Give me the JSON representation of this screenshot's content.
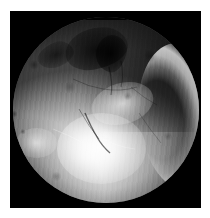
{
  "document": {
    "kind": "medical-endoscopic-still",
    "modality": "arthroscopy",
    "orientation": "portrait",
    "width_px": 210,
    "height_px": 218,
    "caption": "",
    "overlay_text": "",
    "has_annotations": false
  },
  "page": {
    "background_color": "#ffffff"
  },
  "frame": {
    "name": "letterbox-frame",
    "background_color": "#000000",
    "left_px": 10,
    "top_px": 11,
    "width_px": 191,
    "height_px": 197
  },
  "field_of_view": {
    "shape": "circle",
    "diameter_px": 186,
    "top_edge_clipped": true,
    "rim_color": "#000000"
  },
  "palette": {
    "background": "#ffffff",
    "frame": "#000000",
    "highlight": "#ffffff",
    "midtone": "#bdbdbd",
    "shadow": "#3a3a3a",
    "deep_shadow": "#101010"
  },
  "features": [
    {
      "name": "specular-highlight-main",
      "description": "large blown-out specular reflection, lower centre-left",
      "position": "lower-centre-left",
      "intensity": "very-bright"
    },
    {
      "name": "specular-highlight-secondary",
      "description": "softer glare band above the main highlight",
      "position": "centre",
      "intensity": "bright"
    },
    {
      "name": "crescent-glare",
      "description": "bright crescent of reflected light along the right rim of the field of view",
      "position": "right-rim",
      "intensity": "bright"
    },
    {
      "name": "dark-fissure-cluster",
      "description": "cluster of dark crevices and tissue folds",
      "position": "upper-centre",
      "intensity": "dark"
    },
    {
      "name": "shadowed-tissue-fold",
      "description": "broad shadowed tissue fold filling the upper-right quadrant",
      "position": "upper-right",
      "intensity": "dark"
    },
    {
      "name": "fibrous-striations",
      "description": "fine vertical fibrous striations across the tissue surface",
      "position": "full-field",
      "intensity": "texture"
    },
    {
      "name": "rim-vignette",
      "description": "progressive darkening toward the circular rim",
      "position": "rim",
      "intensity": "dark"
    }
  ]
}
